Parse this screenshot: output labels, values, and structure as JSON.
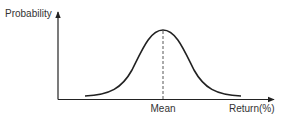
{
  "diagram": {
    "type": "normal-distribution-curve",
    "y_axis_label": "Probability",
    "x_axis_label": "Return(%)",
    "center_marker_label": "Mean",
    "colors": {
      "curve": "#222222",
      "axes": "#222222",
      "text": "#333333",
      "background": "#ffffff"
    }
  }
}
